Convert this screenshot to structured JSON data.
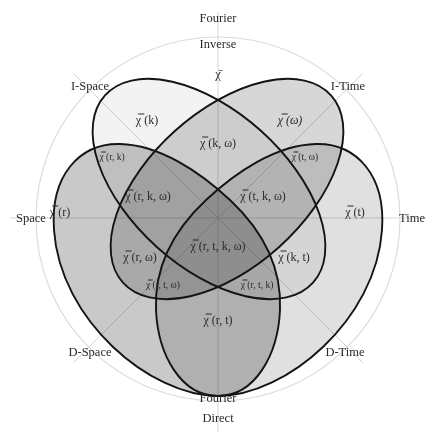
{
  "diagram": {
    "colors": {
      "set_r": "#c9c9c9",
      "set_t": "#e0e0e0",
      "set_k": "#f3f3f3",
      "set_omega": "#d7d7d7",
      "outline": "#141414",
      "guides": "#d6d6d6"
    },
    "axis_labels": {
      "top_line1": "Fourier",
      "top_line2": "Inverse",
      "bottom_line1": "Fourier",
      "bottom_line2": "Direct",
      "left": "Space",
      "right": "Time",
      "upper_left": "I-Space",
      "upper_right": "I-Time",
      "lower_left": "D-Space",
      "lower_right": "D-Time"
    },
    "center_symbol": "χ̄",
    "regions": {
      "k": "χ̿ (k)",
      "omega": "χ̿ (ω)",
      "k_omega": "χ̿ (k, ω)",
      "r_k": "χ̿ (r, k)",
      "t_omega": "χ̿ (t, ω)",
      "r_k_omega": "χ̿ (r, k, ω)",
      "t_k_omega": "χ̿ (t, k, ω)",
      "r": "χ̿ (r)",
      "t": "χ̿ (t)",
      "r_t_k_omega": "χ̿ (r, t, k, ω)",
      "r_omega": "χ̿ (r, ω)",
      "k_t": "χ̿ (k, t)",
      "r_t_omega": "χ̿ (r, t, ω)",
      "r_t_k": "χ̿ (r, t, k)",
      "r_t": "χ̿ (r, t)"
    }
  }
}
